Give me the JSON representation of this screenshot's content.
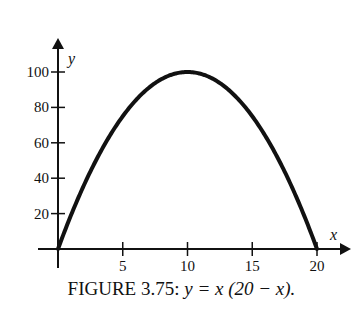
{
  "chart_data": {
    "type": "line",
    "title": "FIGURE 3.75: y = x (20 − x).",
    "equation": "y = x(20 - x)",
    "xlabel": "x",
    "ylabel": "y",
    "xlim": [
      0,
      20
    ],
    "ylim": [
      0,
      100
    ],
    "x_ticks": [
      5,
      10,
      15,
      20
    ],
    "y_ticks": [
      20,
      40,
      60,
      80,
      100
    ],
    "grid": false,
    "legend": null,
    "series": [
      {
        "name": "y = x(20 - x)",
        "x": [
          0,
          1,
          2,
          3,
          4,
          5,
          6,
          7,
          8,
          9,
          10,
          11,
          12,
          13,
          14,
          15,
          16,
          17,
          18,
          19,
          20
        ],
        "values": [
          0,
          19,
          36,
          51,
          64,
          75,
          84,
          91,
          96,
          99,
          100,
          99,
          96,
          91,
          84,
          75,
          64,
          51,
          36,
          19,
          0
        ]
      }
    ]
  },
  "caption": {
    "label": "FIGURE 3.75:",
    "equation": "y = x (20 − x)."
  },
  "axes": {
    "x_var": "x",
    "y_var": "y",
    "x_tick_labels": [
      "5",
      "10",
      "15",
      "20"
    ],
    "y_tick_labels": [
      "20",
      "40",
      "60",
      "80",
      "100"
    ]
  }
}
